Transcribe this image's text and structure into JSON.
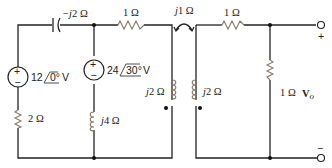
{
  "diagram": {
    "type": "circuit",
    "components": {
      "capacitor": {
        "label": "−j2 Ω"
      },
      "resistor_top_left": {
        "label": "1 Ω"
      },
      "mutual": {
        "label": "j1 Ω"
      },
      "resistor_top_right": {
        "label": "1 Ω"
      },
      "source1": {
        "magnitude": "12",
        "angle": "0°",
        "unit": "V"
      },
      "source2": {
        "magnitude": "24",
        "angle": "30°",
        "unit": "V"
      },
      "resistor_left": {
        "label": "2 Ω"
      },
      "inductor_mid": {
        "label": "j4 Ω"
      },
      "coil_primary": {
        "label": "j2 Ω"
      },
      "coil_secondary": {
        "label": "j2 Ω"
      },
      "resistor_load": {
        "label": "1 Ω"
      },
      "output": {
        "label": "V",
        "subscript": "o",
        "plus": "+",
        "minus": "−"
      }
    },
    "source_signs": {
      "plus": "+",
      "minus": "−"
    }
  }
}
